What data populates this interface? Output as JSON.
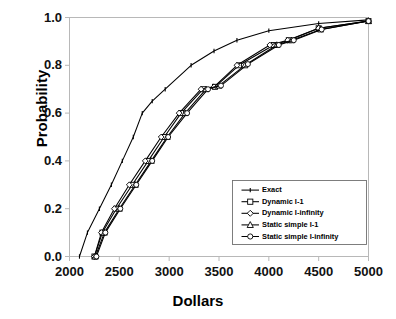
{
  "chart_data": {
    "type": "line",
    "title": "",
    "xlabel": "Dollars",
    "ylabel": "Probability",
    "xlim": [
      2000,
      5000
    ],
    "ylim": [
      0.0,
      1.0
    ],
    "xticks": [
      "2000",
      "2500",
      "3000",
      "3500",
      "4000",
      "4500",
      "5000"
    ],
    "yticks": [
      "0.0",
      "0.2",
      "0.4",
      "0.6",
      "0.8",
      "1.0"
    ],
    "grid": false,
    "legend_position": "lower-right inside plot",
    "series": [
      {
        "name": "Exact",
        "marker": "line-tick",
        "color": "#000000",
        "x": [
          2100,
          2180,
          2300,
          2420,
          2530,
          2640,
          2730,
          2830,
          2960,
          3220,
          3450,
          3680,
          4000,
          4500,
          5000
        ],
        "y": [
          0.0,
          0.1,
          0.2,
          0.3,
          0.4,
          0.5,
          0.6,
          0.65,
          0.7,
          0.8,
          0.86,
          0.905,
          0.945,
          0.975,
          0.99
        ]
      },
      {
        "name": "Dynamic I-1",
        "marker": "square",
        "color": "#000000",
        "x": [
          2250,
          2330,
          2470,
          2630,
          2790,
          2950,
          3120,
          3340,
          3460,
          3700,
          4050,
          4200,
          4500,
          5000
        ],
        "y": [
          0.0,
          0.1,
          0.2,
          0.3,
          0.4,
          0.5,
          0.6,
          0.7,
          0.71,
          0.8,
          0.885,
          0.905,
          0.955,
          0.985
        ]
      },
      {
        "name": "Dynamic I-infinity",
        "marker": "diamond",
        "color": "#000000",
        "x": [
          2250,
          2320,
          2450,
          2600,
          2760,
          2920,
          3100,
          3320,
          3450,
          3680,
          4010,
          4190,
          4500,
          5000
        ],
        "y": [
          0.0,
          0.1,
          0.2,
          0.3,
          0.4,
          0.5,
          0.6,
          0.7,
          0.71,
          0.8,
          0.885,
          0.905,
          0.955,
          0.985
        ]
      },
      {
        "name": "Static simple I-1",
        "marker": "triangle",
        "color": "#000000",
        "x": [
          2260,
          2350,
          2500,
          2660,
          2820,
          2980,
          3160,
          3370,
          3500,
          3760,
          4080,
          4230,
          4520,
          5000
        ],
        "y": [
          0.0,
          0.1,
          0.2,
          0.3,
          0.4,
          0.5,
          0.6,
          0.7,
          0.715,
          0.8,
          0.885,
          0.905,
          0.95,
          0.985
        ]
      },
      {
        "name": "Static simple I-infinity",
        "marker": "circle",
        "color": "#000000",
        "x": [
          2270,
          2360,
          2510,
          2670,
          2830,
          2990,
          3180,
          3390,
          3520,
          3790,
          4100,
          4250,
          4530,
          5000
        ],
        "y": [
          0.0,
          0.1,
          0.2,
          0.3,
          0.4,
          0.5,
          0.6,
          0.7,
          0.715,
          0.805,
          0.885,
          0.905,
          0.95,
          0.985
        ]
      }
    ]
  },
  "axes": {
    "x_title": "Dollars",
    "y_title": "Probability"
  },
  "legend": {
    "items": [
      {
        "label": "Exact"
      },
      {
        "label": "Dynamic I-1"
      },
      {
        "label": "Dynamic I-infinity"
      },
      {
        "label": "Static simple I-1"
      },
      {
        "label": "Static simple I-infinity"
      }
    ]
  },
  "style": {
    "line_color": "#000000",
    "frame_color": "#b8b8b8",
    "background": "#ffffff",
    "marker_fill": "#ffffff"
  }
}
